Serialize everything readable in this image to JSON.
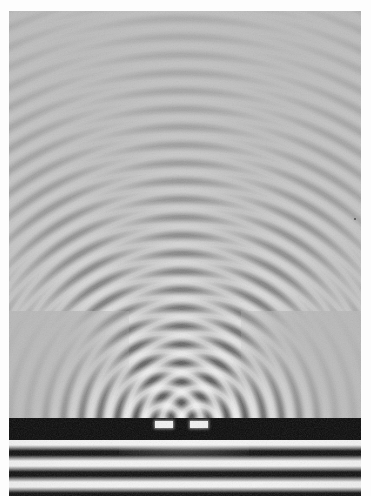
{
  "image": {
    "kind": "photograph",
    "subject": "ripple-tank double-slit interference pattern",
    "width_px": 371,
    "height_px": 496,
    "border": {
      "color": "#fdfdfd",
      "left_px": 9,
      "top_px": 11,
      "right_px": 10,
      "bottom_px": 0
    }
  },
  "colors": {
    "print_white": "#fdfdfd",
    "water_gray": "#b7b7b7",
    "barrier_black": "#0a0a0a",
    "crest_white": "#f4f4f4",
    "trough_black": "#101010",
    "dust_speck": "#4a4a4a"
  },
  "scene": {
    "barrier": {
      "label": "opaque barrier",
      "top_px": 418,
      "height_px": 22,
      "slit_count": 2,
      "slit_width_px": 18,
      "slit_separation_px": 35,
      "slit_centers_px": [
        164,
        199
      ]
    },
    "incoming_waves": {
      "label": "incident plane waves",
      "region_top_px": 440,
      "region_height_px": 56,
      "wavelength_px": 21,
      "band_count": 3,
      "direction": "upward toward barrier"
    },
    "diffracted_waves": {
      "label": "circular wavefronts from each slit",
      "wavelength_px": 18,
      "source_count": 2,
      "fade_distance_px": 400
    },
    "interference": {
      "label": "two-source interference pattern",
      "nodal_lines_visible": 6,
      "antinodal_lines_visible": 7,
      "central_maximum_x_px": 181,
      "shadow_zones": [
        "lower-left",
        "lower-right"
      ]
    },
    "dust_speck": {
      "label": "print dust speck",
      "x_px": 354,
      "y_px": 218
    }
  },
  "chart_data": {
    "type": "heatmap",
    "title": "Double-slit water wave interference (ripple tank photograph)",
    "xlabel": "",
    "ylabel": "",
    "grid": false,
    "legend": "none",
    "xlim": [
      0,
      352
    ],
    "ylim": [
      0,
      485
    ],
    "annotations": [
      "plane waves travel upward from the bottom",
      "barrier with two slits at mid-lower frame",
      "each slit acts as a circular (Huygens) source",
      "overlapping circular waves form radial nodal and antinodal lines",
      "contrast decays with distance from the slits"
    ],
    "sources": [
      {
        "name": "slit-left",
        "x": 155,
        "y": 414,
        "wavelength": 18
      },
      {
        "name": "slit-right",
        "x": 190,
        "y": 414,
        "wavelength": 18
      }
    ]
  }
}
